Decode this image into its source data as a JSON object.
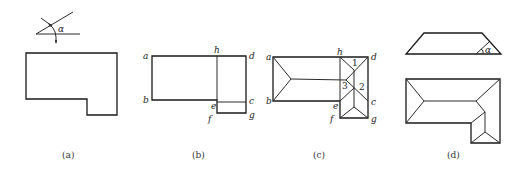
{
  "figures": {
    "a": {
      "caption": "(a)",
      "angle_symbol": "α"
    },
    "b": {
      "caption": "(b)",
      "points": [
        "a",
        "b",
        "c",
        "d",
        "e",
        "f",
        "g",
        "h"
      ]
    },
    "c": {
      "caption": "(c)",
      "points": [
        "a",
        "b",
        "c",
        "d",
        "e",
        "f",
        "g",
        "h"
      ],
      "regions": [
        "1",
        "2",
        "3"
      ]
    },
    "d": {
      "caption": "(d)",
      "angle_symbol": "α"
    }
  }
}
